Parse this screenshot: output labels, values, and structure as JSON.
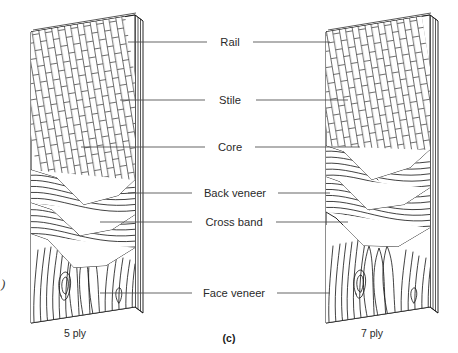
{
  "figure": {
    "caption_center": "(c)",
    "left_panel_caption": "5 ply",
    "right_panel_caption": "7 ply",
    "edge_clipped_glyph": ")"
  },
  "labels": [
    {
      "id": "rail",
      "text": "Rail",
      "y": 42
    },
    {
      "id": "stile",
      "text": "Stile",
      "y": 100
    },
    {
      "id": "core",
      "text": "Core",
      "y": 147
    },
    {
      "id": "back-veneer",
      "text": "Back veneer",
      "y": 193
    },
    {
      "id": "cross-band",
      "text": "Cross band",
      "y": 222
    },
    {
      "id": "face-veneer",
      "text": "Face veneer",
      "y": 293
    }
  ],
  "colors": {
    "background": "#ffffff",
    "ink": "#111111",
    "leader": "#4a4a4a",
    "text": "#2a2a2a"
  }
}
